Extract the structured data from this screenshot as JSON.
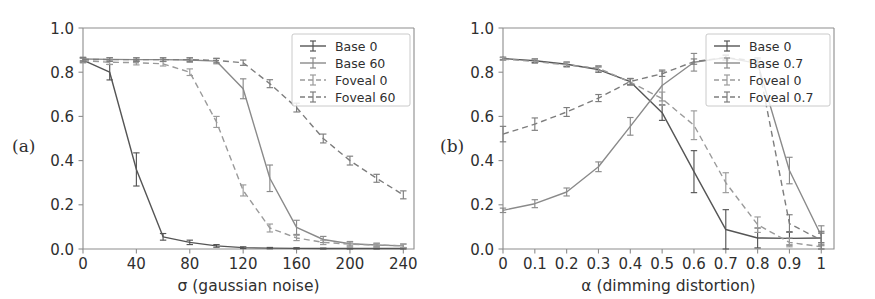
{
  "figure": {
    "panels": [
      {
        "tag": "(a)",
        "xlabel": "σ (gaussian noise)",
        "ylabel": "",
        "xticks": [
          "0",
          "40",
          "80",
          "120",
          "160",
          "200",
          "240"
        ],
        "yticks": [
          "0.0",
          "0.2",
          "0.4",
          "0.6",
          "0.8",
          "1.0"
        ],
        "legend": [
          "Base 0",
          "Base 60",
          "Foveal 0",
          "Foveal 60"
        ]
      },
      {
        "tag": "(b)",
        "xlabel": "α (dimming distortion)",
        "ylabel": "",
        "xticks": [
          "0",
          "0.1",
          "0.2",
          "0.3",
          "0.4",
          "0.5",
          "0.6",
          "0.7",
          "0.8",
          "0.9",
          "1"
        ],
        "yticks": [
          "0.0",
          "0.2",
          "0.4",
          "0.6",
          "0.8",
          "1.0"
        ],
        "legend": [
          "Base 0",
          "Base 0.7",
          "Foveal 0",
          "Foveal 0.7"
        ]
      }
    ],
    "colors": {
      "base_dark": "#555555",
      "base_light": "#8a8a8a",
      "foveal_dark": "#9a9a9a",
      "foveal_light": "#7d7d7d",
      "spine": "#8d8d8d",
      "text": "#2f2f2f",
      "background": "#ffffff"
    }
  },
  "chart_data": [
    {
      "type": "line",
      "panel": "(a)",
      "title": "",
      "xlabel": "σ (gaussian noise)",
      "ylabel": "",
      "xlim": [
        0,
        248
      ],
      "ylim": [
        0.0,
        1.0
      ],
      "xticks": [
        0,
        40,
        80,
        120,
        160,
        200,
        240
      ],
      "yticks": [
        0.0,
        0.2,
        0.4,
        0.6,
        0.8,
        1.0
      ],
      "grid": false,
      "legend_position": "upper right",
      "x": [
        0,
        20,
        40,
        60,
        80,
        100,
        120,
        140,
        160,
        180,
        200,
        220,
        240
      ],
      "series": [
        {
          "name": "Base 0",
          "style": "solid",
          "color": "#555555",
          "values": [
            0.855,
            0.8,
            0.36,
            0.055,
            0.03,
            0.014,
            0.006,
            0.004,
            0.003,
            0.002,
            0.002,
            0.002,
            0.002
          ],
          "errors": [
            0.01,
            0.035,
            0.075,
            0.015,
            0.01,
            0.006,
            0.004,
            0.003,
            0.003,
            0.002,
            0.002,
            0.002,
            0.002
          ]
        },
        {
          "name": "Base 60",
          "style": "solid",
          "color": "#8a8a8a",
          "values": [
            0.86,
            0.858,
            0.857,
            0.857,
            0.855,
            0.85,
            0.725,
            0.32,
            0.098,
            0.043,
            0.024,
            0.018,
            0.014
          ],
          "errors": [
            0.008,
            0.008,
            0.008,
            0.008,
            0.01,
            0.012,
            0.045,
            0.06,
            0.032,
            0.014,
            0.01,
            0.008,
            0.008
          ]
        },
        {
          "name": "Foveal 0",
          "style": "dashed",
          "color": "#9a9a9a",
          "values": [
            0.852,
            0.845,
            0.843,
            0.838,
            0.8,
            0.575,
            0.265,
            0.095,
            0.05,
            0.03,
            0.022,
            0.018,
            0.015
          ],
          "errors": [
            0.01,
            0.01,
            0.01,
            0.01,
            0.015,
            0.025,
            0.025,
            0.018,
            0.012,
            0.01,
            0.009,
            0.008,
            0.008
          ]
        },
        {
          "name": "Foveal 60",
          "style": "dashed",
          "color": "#7d7d7d",
          "values": [
            0.858,
            0.857,
            0.857,
            0.857,
            0.857,
            0.853,
            0.843,
            0.748,
            0.64,
            0.5,
            0.4,
            0.32,
            0.245
          ],
          "errors": [
            0.008,
            0.008,
            0.008,
            0.008,
            0.008,
            0.01,
            0.012,
            0.018,
            0.02,
            0.02,
            0.02,
            0.018,
            0.018
          ]
        }
      ]
    },
    {
      "type": "line",
      "panel": "(b)",
      "title": "",
      "xlabel": "α (dimming distortion)",
      "ylabel": "",
      "xlim": [
        0,
        1.04
      ],
      "ylim": [
        0.0,
        1.0
      ],
      "xticks": [
        0,
        0.1,
        0.2,
        0.3,
        0.4,
        0.5,
        0.6,
        0.7,
        0.8,
        0.9,
        1.0
      ],
      "yticks": [
        0.0,
        0.2,
        0.4,
        0.6,
        0.8,
        1.0
      ],
      "grid": false,
      "legend_position": "upper right",
      "x": [
        0,
        0.1,
        0.2,
        0.3,
        0.4,
        0.5,
        0.6,
        0.7,
        0.8,
        0.9,
        1.0
      ],
      "series": [
        {
          "name": "Base 0",
          "style": "solid",
          "color": "#555555",
          "values": [
            0.862,
            0.852,
            0.836,
            0.812,
            0.757,
            0.617,
            0.35,
            0.088,
            0.05,
            0.048,
            0.05
          ],
          "errors": [
            0.006,
            0.008,
            0.01,
            0.012,
            0.014,
            0.035,
            0.095,
            0.09,
            0.045,
            0.03,
            0.022
          ]
        },
        {
          "name": "Base 0.7",
          "style": "solid",
          "color": "#8a8a8a",
          "values": [
            0.175,
            0.205,
            0.258,
            0.372,
            0.555,
            0.74,
            0.845,
            0.866,
            0.84,
            0.355,
            0.06
          ],
          "errors": [
            0.01,
            0.018,
            0.018,
            0.022,
            0.04,
            0.07,
            0.04,
            0.012,
            0.02,
            0.06,
            0.045
          ]
        },
        {
          "name": "Foveal 0",
          "style": "dashed",
          "color": "#9a9a9a",
          "values": [
            0.86,
            0.848,
            0.833,
            0.818,
            0.755,
            0.68,
            0.56,
            0.3,
            0.11,
            0.03,
            0.01
          ],
          "errors": [
            0.006,
            0.008,
            0.01,
            0.012,
            0.015,
            0.03,
            0.065,
            0.045,
            0.035,
            0.02,
            0.01
          ]
        },
        {
          "name": "Foveal 0.7",
          "style": "dashed",
          "color": "#7d7d7d",
          "values": [
            0.52,
            0.565,
            0.62,
            0.683,
            0.758,
            0.793,
            0.848,
            0.866,
            0.85,
            0.115,
            0.04
          ],
          "errors": [
            0.035,
            0.028,
            0.02,
            0.016,
            0.014,
            0.012,
            0.012,
            0.01,
            0.015,
            0.04,
            0.04
          ]
        }
      ]
    }
  ]
}
